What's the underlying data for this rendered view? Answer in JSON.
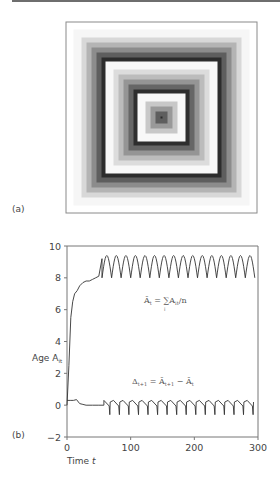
{
  "figure": {
    "panel_a_label": "(a)",
    "panel_b_label": "(b)"
  },
  "panel_a": {
    "description": "concentric square rings of grey gradients",
    "frame_color": "#8a8a8a",
    "rings": [
      {
        "inset": 0,
        "color": "#f6f6f6"
      },
      {
        "inset": 8,
        "color": "#d8d8d8"
      },
      {
        "inset": 13,
        "color": "#b4b4b4"
      },
      {
        "inset": 18,
        "color": "#8c8c8c"
      },
      {
        "inset": 23,
        "color": "#5e5e5e"
      },
      {
        "inset": 28,
        "color": "#2c2c2c"
      },
      {
        "inset": 32,
        "color": "#f8f8f8"
      },
      {
        "inset": 40,
        "color": "#dcdcdc"
      },
      {
        "inset": 45,
        "color": "#bcbcbc"
      },
      {
        "inset": 50,
        "color": "#959595"
      },
      {
        "inset": 55,
        "color": "#666666"
      },
      {
        "inset": 60,
        "color": "#2e2e2e"
      },
      {
        "inset": 64,
        "color": "#f8f8f8"
      },
      {
        "inset": 72,
        "color": "#c8c8c8"
      },
      {
        "inset": 77,
        "color": "#999999"
      },
      {
        "inset": 82,
        "color": "#5e5e5e"
      },
      {
        "inset": 87,
        "color": "#2a2a2a"
      },
      {
        "inset": 91,
        "color": "#ffffff"
      }
    ]
  },
  "chart_data": {
    "type": "line",
    "title": "",
    "xlabel": "Time t",
    "ylabel": "Age A_it",
    "xlim": [
      0,
      300
    ],
    "ylim": [
      -2,
      10
    ],
    "xticks": [
      0,
      100,
      200,
      300
    ],
    "yticks": [
      -2,
      0,
      2,
      4,
      6,
      8,
      10
    ],
    "grid": false,
    "annotations": [
      {
        "text": "Ā_t = Σ_i A_it / n",
        "x": 150,
        "y": 7.2
      },
      {
        "text": "Δ_{t+1} = Ā_{t+1} − Ā_t",
        "x": 150,
        "y": 1.4
      }
    ],
    "series": [
      {
        "name": "mean age Ā_t",
        "x": [
          0,
          3,
          6,
          9,
          12,
          16,
          20,
          25,
          30,
          35,
          40,
          45,
          50,
          55
        ],
        "values": [
          0.0,
          2.5,
          5.5,
          6.5,
          7.0,
          7.2,
          7.5,
          7.7,
          7.8,
          7.8,
          7.9,
          8.0,
          8.1,
          9.2
        ],
        "oscillation": {
          "start": 55,
          "end": 290,
          "period": 15,
          "min": 8.0,
          "max": 9.4
        }
      },
      {
        "name": "Δ_{t+1}",
        "x": [
          0,
          5,
          10,
          15,
          20,
          25,
          30,
          40,
          50,
          58
        ],
        "values": [
          0.3,
          0.3,
          0.3,
          0.35,
          0.1,
          0.05,
          0.0,
          0.0,
          0.0,
          0.0
        ],
        "oscillation": {
          "start": 58,
          "end": 290,
          "period": 15,
          "min": -0.6,
          "max": 0.3,
          "shape": "sawtooth"
        }
      }
    ]
  },
  "axis_text": {
    "ylabel_main": "Age A",
    "ylabel_sub": "it",
    "xlabel_main": "Time ",
    "xlabel_var": "t",
    "xtick_labels": [
      "0",
      "100",
      "200",
      "300"
    ],
    "ytick_labels": [
      "−2",
      "0",
      "2",
      "4",
      "6",
      "8",
      "10"
    ]
  },
  "equations": {
    "mean_lhs": "Ā",
    "mean_lhs_sub": "t",
    "mean_rhs": "= ∑A",
    "mean_rhs_sub": "it",
    "mean_tail": "/n",
    "mean_sum_index": "i",
    "delta_lhs": "Δ",
    "delta_lhs_sub": "t+1",
    "delta_eq": " = Ā",
    "delta_rhs_sub": "t+1",
    "delta_minus": " − Ā",
    "delta_tail_sub": "t"
  }
}
